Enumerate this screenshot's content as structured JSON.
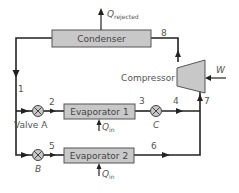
{
  "diagram": {
    "components": {
      "condenser": "Condenser",
      "compressor": "Compressor",
      "evaporator1": "Evaporator 1",
      "evaporator2": "Evaporator 2",
      "valve_a": "Valve A",
      "valve_b": "B",
      "valve_c": "C"
    },
    "heat_labels": {
      "q_rejected_main": "Q",
      "q_rejected_sub": "rejected",
      "q_in_main": "Q",
      "q_in_sub": "in",
      "work": "W"
    },
    "state_points": [
      "1",
      "2",
      "3",
      "4",
      "5",
      "6",
      "7",
      "8"
    ],
    "colors": {
      "box_fill": "#c8c8c8",
      "box_stroke": "#555555",
      "line": "#222222",
      "text": "#555555"
    }
  }
}
